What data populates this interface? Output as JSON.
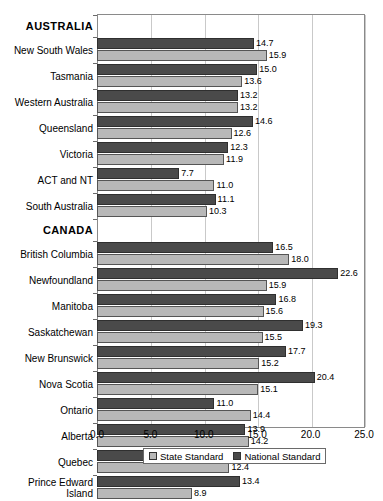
{
  "chart_data": {
    "type": "bar",
    "orientation": "horizontal",
    "title": "",
    "xlabel": "",
    "ylabel": "",
    "xlim": [
      0.0,
      25.0
    ],
    "xticks": [
      "0.0",
      "5.0",
      "10.0",
      "15.0",
      "20.0",
      "25.0"
    ],
    "grid": true,
    "legend_position": "bottom",
    "series": [
      {
        "name": "State Standard",
        "color": "#b8b8b8",
        "values": [
          15.9,
          13.6,
          13.2,
          12.6,
          11.9,
          11.0,
          10.3,
          18.0,
          15.9,
          15.6,
          15.5,
          15.2,
          15.1,
          14.4,
          14.2,
          12.4,
          8.9
        ]
      },
      {
        "name": "National Standard",
        "color": "#4a4a4a",
        "values": [
          14.7,
          15.0,
          13.2,
          14.6,
          12.3,
          7.7,
          11.1,
          16.5,
          22.6,
          16.8,
          19.3,
          17.7,
          20.4,
          11.0,
          13.9,
          15.3,
          13.4
        ]
      }
    ],
    "categories": [
      "New South Wales",
      "Tasmania",
      "Western Australia",
      "Queensland",
      "Victoria",
      "ACT and NT",
      "South Australia",
      "British Columbia",
      "Newfoundland",
      "Manitoba",
      "Saskatchewan",
      "New Brunswick",
      "Nova Scotia",
      "Ontario",
      "Alberta",
      "Quebec",
      "Prince Edward Island"
    ],
    "groups": [
      {
        "header": "AUSTRALIA",
        "rows": [
          {
            "label": "New South Wales",
            "national": 14.7,
            "state": 15.9,
            "national_text": "14.7",
            "state_text": "15.9"
          },
          {
            "label": "Tasmania",
            "national": 15.0,
            "state": 13.6,
            "national_text": "15.0",
            "state_text": "13.6"
          },
          {
            "label": "Western Australia",
            "national": 13.2,
            "state": 13.2,
            "national_text": "13.2",
            "state_text": "13.2"
          },
          {
            "label": "Queensland",
            "national": 14.6,
            "state": 12.6,
            "national_text": "14.6",
            "state_text": "12.6"
          },
          {
            "label": "Victoria",
            "national": 12.3,
            "state": 11.9,
            "national_text": "12.3",
            "state_text": "11.9"
          },
          {
            "label": "ACT and NT",
            "national": 7.7,
            "state": 11.0,
            "national_text": "7.7",
            "state_text": "11.0"
          },
          {
            "label": "South Australia",
            "national": 11.1,
            "state": 10.3,
            "national_text": "11.1",
            "state_text": "10.3"
          }
        ]
      },
      {
        "header": "CANADA",
        "rows": [
          {
            "label": "British Columbia",
            "national": 16.5,
            "state": 18.0,
            "national_text": "16.5",
            "state_text": "18.0"
          },
          {
            "label": "Newfoundland",
            "national": 22.6,
            "state": 15.9,
            "national_text": "22.6",
            "state_text": "15.9"
          },
          {
            "label": "Manitoba",
            "national": 16.8,
            "state": 15.6,
            "national_text": "16.8",
            "state_text": "15.6"
          },
          {
            "label": "Saskatchewan",
            "national": 19.3,
            "state": 15.5,
            "national_text": "19.3",
            "state_text": "15.5"
          },
          {
            "label": "New Brunswick",
            "national": 17.7,
            "state": 15.2,
            "national_text": "17.7",
            "state_text": "15.2"
          },
          {
            "label": "Nova Scotia",
            "national": 20.4,
            "state": 15.1,
            "national_text": "20.4",
            "state_text": "15.1"
          },
          {
            "label": "Ontario",
            "national": 11.0,
            "state": 14.4,
            "national_text": "11.0",
            "state_text": "14.4"
          },
          {
            "label": "Alberta",
            "national": 13.9,
            "state": 14.2,
            "national_text": "13.9",
            "state_text": "14.2"
          },
          {
            "label": "Quebec",
            "national": 15.3,
            "state": 12.4,
            "national_text": "15.3",
            "state_text": "12.4"
          },
          {
            "label": "Prince Edward Island",
            "national": 13.4,
            "state": 8.9,
            "national_text": "13.4",
            "state_text": "8.9"
          }
        ]
      }
    ]
  },
  "legend": {
    "items": [
      {
        "label": "State Standard",
        "color": "#b8b8b8",
        "swatch": "state"
      },
      {
        "label": "National Standard",
        "color": "#4a4a4a",
        "swatch": "national"
      }
    ]
  }
}
